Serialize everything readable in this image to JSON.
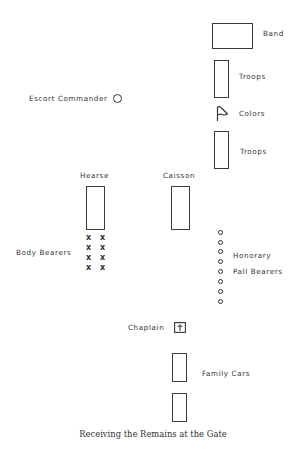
{
  "diagram": {
    "caption": "Receiving the Remains at the Gate",
    "labels": {
      "band": "Band",
      "troops_top": "Troops",
      "colors": "Colors",
      "troops_bottom": "Troops",
      "escort_commander": "Escort Commander",
      "hearse": "Hearse",
      "caisson": "Caisson",
      "body_bearers": "Body Bearers",
      "honorary": "Honorary",
      "pall_bearers": "Pall Bearers",
      "chaplain": "Chaplain",
      "family_cars": "Family Cars"
    },
    "symbols": {
      "body_bearer_mark": "x",
      "body_bearer_count": 8,
      "honorary_pall_bearer_count": 8,
      "colors_icon": "flag-icon",
      "chaplain_icon": "cross-box-icon",
      "escort_commander_icon": "circle-icon"
    },
    "colors": {
      "ink": "#333333",
      "background": "#ffffff"
    }
  }
}
